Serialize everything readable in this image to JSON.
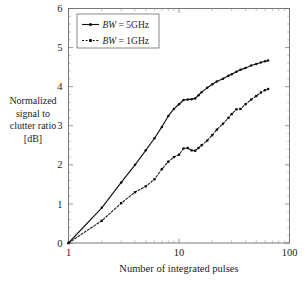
{
  "chart_data": {
    "type": "line",
    "title": "",
    "xlabel": "Number of integrated pulses",
    "ylabel": "Normalized signal to clutter ratio [dB]",
    "ylabel_lines": [
      "Normalized",
      "signal to",
      "clutter ratio",
      "[dB]"
    ],
    "xscale": "log",
    "yscale": "linear",
    "xlim": [
      1,
      100
    ],
    "ylim": [
      0,
      6
    ],
    "xticks": [
      1,
      10,
      100
    ],
    "xtick_labels": [
      "1",
      "10",
      "100"
    ],
    "yticks": [
      0,
      1,
      2,
      3,
      4,
      5,
      6
    ],
    "ytick_labels": [
      "0",
      "1",
      "2",
      "3",
      "4",
      "5",
      "6"
    ],
    "grid": false,
    "legend_position": "top-left",
    "series": [
      {
        "name": "BW = 5GHz",
        "legend_prefix_italic": "BW",
        "legend_suffix": " = 5GHz",
        "style": "solid",
        "marker": "circle",
        "x": [
          1,
          2,
          3,
          4,
          5,
          6,
          7,
          8,
          9,
          10,
          11,
          12,
          13,
          14,
          15,
          16,
          18,
          20,
          22,
          25,
          28,
          30,
          33,
          36,
          40,
          45,
          50,
          55,
          60,
          64
        ],
        "y": [
          0.0,
          0.9,
          1.55,
          2.0,
          2.37,
          2.68,
          2.97,
          3.25,
          3.43,
          3.55,
          3.66,
          3.67,
          3.68,
          3.7,
          3.78,
          3.86,
          3.97,
          4.06,
          4.13,
          4.2,
          4.28,
          4.32,
          4.38,
          4.43,
          4.48,
          4.54,
          4.58,
          4.62,
          4.65,
          4.67
        ]
      },
      {
        "name": "BW = 1GHz",
        "legend_prefix_italic": "BW",
        "legend_suffix": " = 1GHz",
        "style": "dashed",
        "marker": "square",
        "x": [
          1,
          2,
          3,
          4,
          5,
          6,
          7,
          8,
          9,
          10,
          11,
          12,
          13,
          14,
          15,
          16,
          18,
          20,
          22,
          25,
          28,
          30,
          33,
          36,
          40,
          45,
          50,
          55,
          60,
          64
        ],
        "y": [
          0.0,
          0.57,
          1.02,
          1.3,
          1.45,
          1.63,
          1.89,
          2.08,
          2.2,
          2.26,
          2.42,
          2.43,
          2.37,
          2.36,
          2.43,
          2.5,
          2.62,
          2.76,
          2.9,
          3.05,
          3.2,
          3.3,
          3.42,
          3.43,
          3.55,
          3.67,
          3.76,
          3.85,
          3.91,
          3.94
        ]
      }
    ]
  },
  "legend": {
    "entries": [
      {
        "label": "BW = 5GHz",
        "italic_part": "BW",
        "rest": " = 5GHz",
        "style": "solid"
      },
      {
        "label": "BW = 1GHz",
        "italic_part": "BW",
        "rest": " = 1GHz",
        "style": "dashed"
      }
    ]
  }
}
